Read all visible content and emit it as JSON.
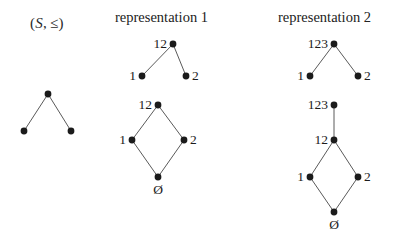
{
  "figure": {
    "width": 397,
    "height": 241,
    "background": "#ffffff",
    "edge_color": "#5a5a5a",
    "node_color": "#1b1b1b",
    "text_color": "#1c1c1c"
  },
  "poset": {
    "label_open": "(",
    "label_set": "S",
    "label_comma": ",",
    "label_relation": "≤",
    "label_close": ")",
    "label_full": "(S, ≤)"
  },
  "headings": {
    "representation_1": "representation 1",
    "representation_2": "representation 2"
  },
  "diagrams": {
    "poset_hasse": {
      "name": "(S, ≤)",
      "nodes": [
        {
          "id": "top",
          "x": 48,
          "y": 94,
          "label": ""
        },
        {
          "id": "left",
          "x": 24,
          "y": 131,
          "label": ""
        },
        {
          "id": "right",
          "x": 71,
          "y": 131,
          "label": ""
        }
      ],
      "edges": [
        [
          "top",
          "left"
        ],
        [
          "top",
          "right"
        ]
      ]
    },
    "rep1_tree": {
      "name": "representation 1 upper tree",
      "nodes": [
        {
          "id": "top",
          "x": 173,
          "y": 44,
          "label": "12",
          "label_pos": "left"
        },
        {
          "id": "left",
          "x": 142,
          "y": 76,
          "label": "1",
          "label_pos": "left"
        },
        {
          "id": "right",
          "x": 186,
          "y": 76,
          "label": "2",
          "label_pos": "right"
        }
      ],
      "edges": [
        [
          "top",
          "left"
        ],
        [
          "top",
          "right"
        ]
      ]
    },
    "rep1_lattice": {
      "name": "representation 1 lattice",
      "nodes": [
        {
          "id": "top",
          "x": 158,
          "y": 105,
          "label": "12",
          "label_pos": "left"
        },
        {
          "id": "left",
          "x": 132,
          "y": 140,
          "label": "1",
          "label_pos": "left"
        },
        {
          "id": "right",
          "x": 184,
          "y": 140,
          "label": "2",
          "label_pos": "right"
        },
        {
          "id": "bottom",
          "x": 158,
          "y": 177,
          "label": "Ø",
          "label_pos": "below"
        }
      ],
      "edges": [
        [
          "top",
          "left"
        ],
        [
          "top",
          "right"
        ],
        [
          "left",
          "bottom"
        ],
        [
          "right",
          "bottom"
        ]
      ]
    },
    "rep2_tree": {
      "name": "representation 2 upper tree",
      "nodes": [
        {
          "id": "top",
          "x": 334,
          "y": 44,
          "label": "123",
          "label_pos": "left"
        },
        {
          "id": "left",
          "x": 310,
          "y": 76,
          "label": "1",
          "label_pos": "left"
        },
        {
          "id": "right",
          "x": 358,
          "y": 76,
          "label": "2",
          "label_pos": "right"
        }
      ],
      "edges": [
        [
          "top",
          "left"
        ],
        [
          "top",
          "right"
        ]
      ]
    },
    "rep2_lattice": {
      "name": "representation 2 lattice",
      "nodes": [
        {
          "id": "apex",
          "x": 334,
          "y": 105,
          "label": "123",
          "label_pos": "left"
        },
        {
          "id": "top",
          "x": 334,
          "y": 140,
          "label": "12",
          "label_pos": "left"
        },
        {
          "id": "left",
          "x": 310,
          "y": 177,
          "label": "1",
          "label_pos": "left"
        },
        {
          "id": "right",
          "x": 358,
          "y": 177,
          "label": "2",
          "label_pos": "right"
        },
        {
          "id": "bottom",
          "x": 334,
          "y": 212,
          "label": "Ø",
          "label_pos": "below"
        }
      ],
      "edges": [
        [
          "apex",
          "top"
        ],
        [
          "top",
          "left"
        ],
        [
          "top",
          "right"
        ],
        [
          "left",
          "bottom"
        ],
        [
          "right",
          "bottom"
        ]
      ]
    }
  },
  "labels": {
    "poset_label_x": 30,
    "poset_label_y": 16,
    "rep1_heading_x": 115,
    "rep1_heading_y": 10,
    "rep2_heading_x": 278,
    "rep2_heading_y": 10
  }
}
